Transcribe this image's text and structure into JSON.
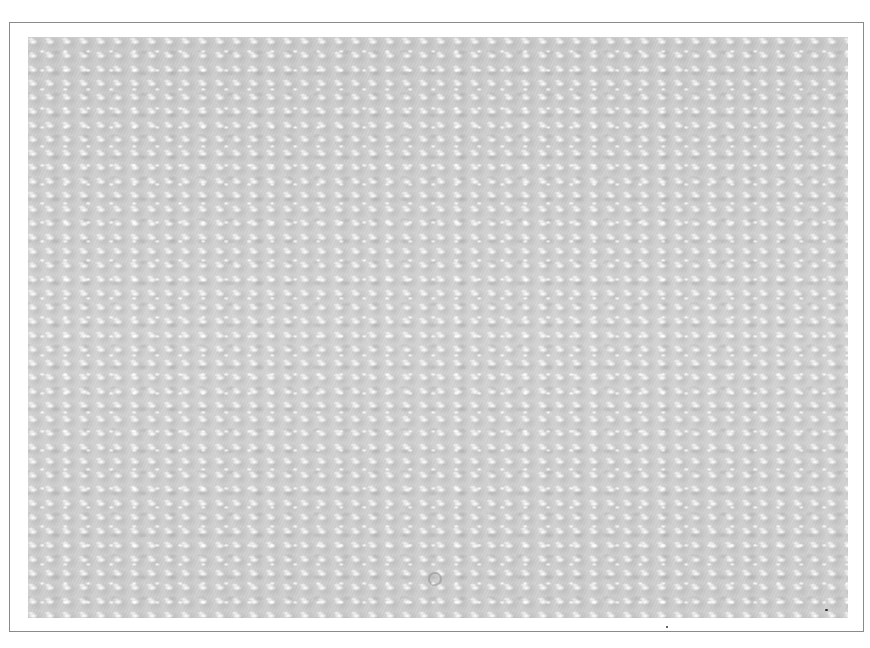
{
  "image": {
    "description": "Grayscale photograph of bubble wrap texture inside a thin gray bordered frame",
    "colors": {
      "background": "#ffffff",
      "frame_border": "#8a8a8a",
      "texture_base": "#c9c9c9",
      "highlight": "#ffffff",
      "speck": "#333333"
    }
  }
}
